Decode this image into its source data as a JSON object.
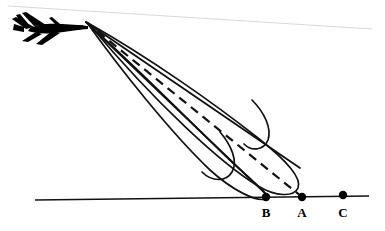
{
  "figure": {
    "kind": "diagram",
    "title": "",
    "background_color": "#ffffff",
    "stroke_color": "#000000",
    "horizon_color": "#d8d8d8",
    "width": 385,
    "height": 231
  },
  "aircraft": {
    "name": "fighter-jet-silhouette",
    "color": "#000000",
    "nose_x": 86,
    "nose_y": 22
  },
  "horizon": {
    "name": "horizon-line",
    "x1": 8,
    "y1": 6,
    "x2": 372,
    "y2": 29,
    "color": "#d9d9d9",
    "width": 1
  },
  "ground": {
    "name": "ground-line",
    "x1": 35,
    "y1": 200,
    "x2": 369,
    "y2": 196,
    "color": "#111111",
    "width": 1.6
  },
  "apex": {
    "x": 86,
    "y": 22
  },
  "rays": [
    {
      "name": "upper-bound-ray",
      "style": "solid",
      "x1": 86,
      "y1": 22,
      "x2": 300,
      "y2": 168
    },
    {
      "name": "center-aim-ray",
      "style": "dashed",
      "x1": 86,
      "y1": 22,
      "x2": 302,
      "y2": 197
    },
    {
      "name": "lower-bound-ray",
      "style": "solid",
      "x1": 86,
      "y1": 22,
      "x2": 268,
      "y2": 196
    }
  ],
  "ground_points": [
    {
      "label": "B",
      "name": "ground-point-b",
      "x": 266,
      "y": 197,
      "label_x": 266,
      "label_y": 212
    },
    {
      "label": "A",
      "name": "ground-point-a",
      "x": 302,
      "y": 197,
      "label_x": 302,
      "label_y": 212
    },
    {
      "label": "C",
      "name": "ground-point-c",
      "x": 343,
      "y": 195,
      "label_x": 343,
      "label_y": 212
    }
  ],
  "lobes": [
    {
      "name": "upper-dispersion-lobe",
      "note": "elongated teardrop closing near point A"
    },
    {
      "name": "lower-dispersion-lobe",
      "note": "elongated teardrop closing near point B"
    }
  ],
  "hooks": [
    {
      "name": "upper-hook-curve"
    },
    {
      "name": "lower-hook-curve"
    }
  ]
}
